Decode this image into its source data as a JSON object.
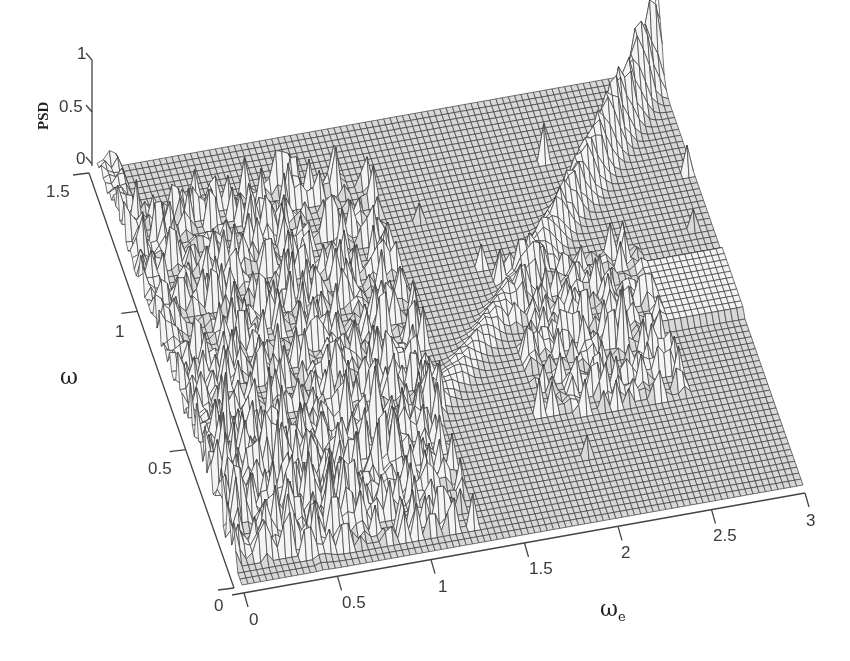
{
  "chart_data": {
    "type": "surface",
    "title": "",
    "xlabel": "ωe",
    "xlabel_main": "ω",
    "xlabel_sub": "e",
    "ylabel": "ω",
    "zlabel": "PSD",
    "x_ticks": [
      "0",
      "0.5",
      "1",
      "1.5",
      "2",
      "2.5",
      "3"
    ],
    "y_ticks": [
      "0",
      "0.5",
      "1",
      "1.5"
    ],
    "z_ticks": [
      "0",
      "0.5",
      "1"
    ],
    "xlim": [
      0,
      3
    ],
    "ylim": [
      0,
      1.5
    ],
    "zlim": [
      0,
      1
    ],
    "grid": false,
    "legend": null,
    "mesh_color": "#3c3c3c",
    "face_color": "#ffffff",
    "features": [
      {
        "description": "Dominant ridge rising along a curve from (ωe≈0.6, ω≈0.1) to (ωe≈3, ω≈1.5), peaking near PSD≈1 at the back-right corner"
      },
      {
        "description": "Dense noisy peaks for ωe in [0, 1.3], ω in [0.1, 1.3]"
      },
      {
        "description": "Cluster of peaks for ωe in [1.8, 2.6], ω in [0.4, 0.9]"
      },
      {
        "description": "Flat near-zero plateau elsewhere"
      }
    ]
  },
  "labels": {
    "psd": "PSD",
    "omega": "ω",
    "omega_e_main": "ω",
    "omega_e_sub": "e"
  }
}
